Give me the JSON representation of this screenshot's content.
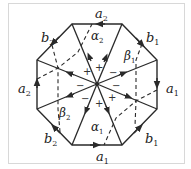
{
  "diagram": {
    "type": "octagon-surface-identification",
    "colors": {
      "line": "#2a2a2a",
      "frame": "#d8d8d8",
      "background": "#ffffff"
    },
    "edge_labels": [
      {
        "id": "top",
        "base": "a",
        "sub": "2"
      },
      {
        "id": "upper-right",
        "base": "b",
        "sub": "1"
      },
      {
        "id": "right",
        "base": "a",
        "sub": "1"
      },
      {
        "id": "lower-right",
        "base": "b",
        "sub": "1"
      },
      {
        "id": "bottom",
        "base": "a",
        "sub": "1"
      },
      {
        "id": "lower-left",
        "base": "b",
        "sub": "2"
      },
      {
        "id": "left",
        "base": "a",
        "sub": "2"
      },
      {
        "id": "upper-left",
        "base": "b",
        "sub": "2"
      }
    ],
    "curve_labels": [
      {
        "id": "alpha2",
        "base": "α",
        "sub": "2"
      },
      {
        "id": "beta1",
        "base": "β",
        "sub": "1"
      },
      {
        "id": "beta2",
        "base": "β",
        "sub": "2"
      },
      {
        "id": "alpha1",
        "base": "α",
        "sub": "1"
      }
    ],
    "signs": [
      "+",
      "+",
      "−",
      "−",
      "−",
      "−",
      "+",
      "+"
    ]
  }
}
